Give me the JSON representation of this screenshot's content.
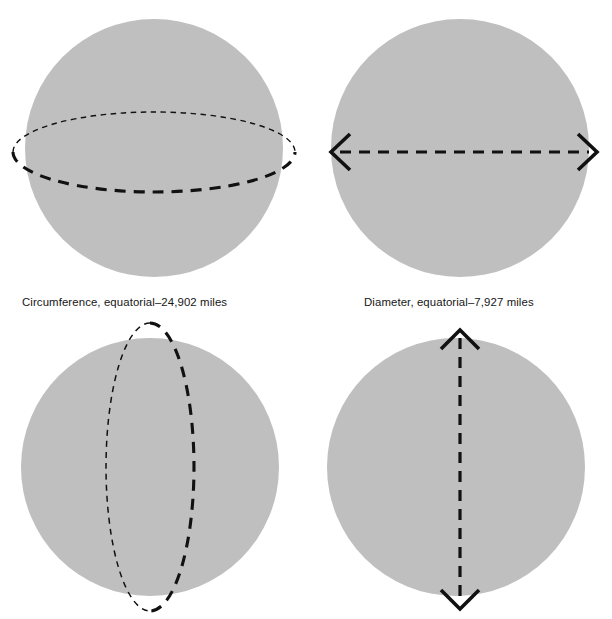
{
  "figure": {
    "background_color": "#ffffff",
    "sphere_fill_color": "#bfbfbf",
    "annotation_color": "#111111"
  },
  "panels": [
    {
      "id": "circumference-equatorial",
      "sphere_label": "sphere-with-equatorial-circle",
      "annotation": "dashed-horizontal-ellipse",
      "caption": "Circumference, equatorial–24,902 miles"
    },
    {
      "id": "diameter-equatorial",
      "sphere_label": "sphere-with-horizontal-arrow",
      "annotation": "dashed-horizontal-double-arrow",
      "caption": "Diameter, equatorial–7,927 miles"
    },
    {
      "id": "circumference-polar",
      "sphere_label": "sphere-with-meridian-circle",
      "annotation": "dashed-vertical-ellipse",
      "caption": ""
    },
    {
      "id": "diameter-polar",
      "sphere_label": "sphere-with-vertical-arrow",
      "annotation": "dashed-vertical-double-arrow",
      "caption": ""
    }
  ],
  "captions": {
    "circumference_equatorial": "Circumference, equatorial–24,902 miles",
    "diameter_equatorial": "Diameter, equatorial–7,927 miles"
  },
  "measurements": {
    "equatorial_circumference_miles": "24,902",
    "equatorial_diameter_miles": "7,927"
  }
}
